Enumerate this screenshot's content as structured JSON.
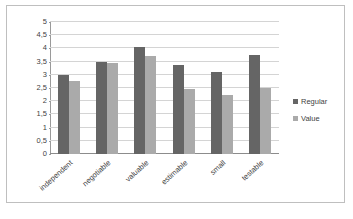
{
  "chart_data": {
    "type": "bar",
    "title": "",
    "xlabel": "",
    "ylabel": "",
    "ylim": [
      0,
      5
    ],
    "grid": true,
    "legend_position": "right",
    "categories": [
      "independent",
      "negotiable",
      "valuable",
      "estimable",
      "small",
      "testable"
    ],
    "ytick_labels": [
      "0",
      "0,5",
      "1",
      "1,5",
      "2",
      "2,5",
      "3",
      "3,5",
      "4",
      "4,5",
      "5"
    ],
    "ytick_values": [
      0,
      0.5,
      1,
      1.5,
      2,
      2.5,
      3,
      3.5,
      4,
      4.5,
      5
    ],
    "series": [
      {
        "name": "Regular",
        "color": "#656565",
        "values": [
          3.0,
          3.48,
          4.05,
          3.38,
          3.09,
          3.75
        ]
      },
      {
        "name": "Value",
        "color": "#aaaaaa",
        "values": [
          2.78,
          3.44,
          3.72,
          2.46,
          2.23,
          2.5
        ]
      }
    ]
  }
}
